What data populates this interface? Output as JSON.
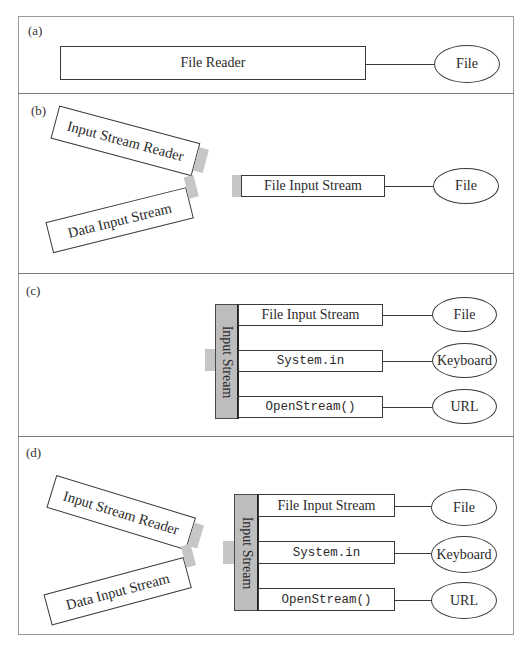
{
  "panels": {
    "a": {
      "label": "(a)",
      "reader": "File Reader",
      "source": "File"
    },
    "b": {
      "label": "(b)",
      "wrappers": [
        "Input Stream Reader",
        "Data Input Stream"
      ],
      "stream": "File Input Stream",
      "source": "File"
    },
    "c": {
      "label": "(c)",
      "bar_label": "Input Stream",
      "streams": [
        "File Input Stream",
        "System.in",
        "OpenStream()"
      ],
      "sources": [
        "File",
        "Keyboard",
        "URL"
      ]
    },
    "d": {
      "label": "(d)",
      "wrappers": [
        "Input Stream Reader",
        "Data Input Stream"
      ],
      "bar_label": "Input Stream",
      "streams": [
        "File Input Stream",
        "System.in",
        "OpenStream()"
      ],
      "sources": [
        "File",
        "Keyboard",
        "URL"
      ]
    }
  },
  "colors": {
    "stroke": "#3a3a3a",
    "bar_fill": "#bdbdbd",
    "tab_fill": "#c6c6c6",
    "frame": "#9a9a9a"
  }
}
